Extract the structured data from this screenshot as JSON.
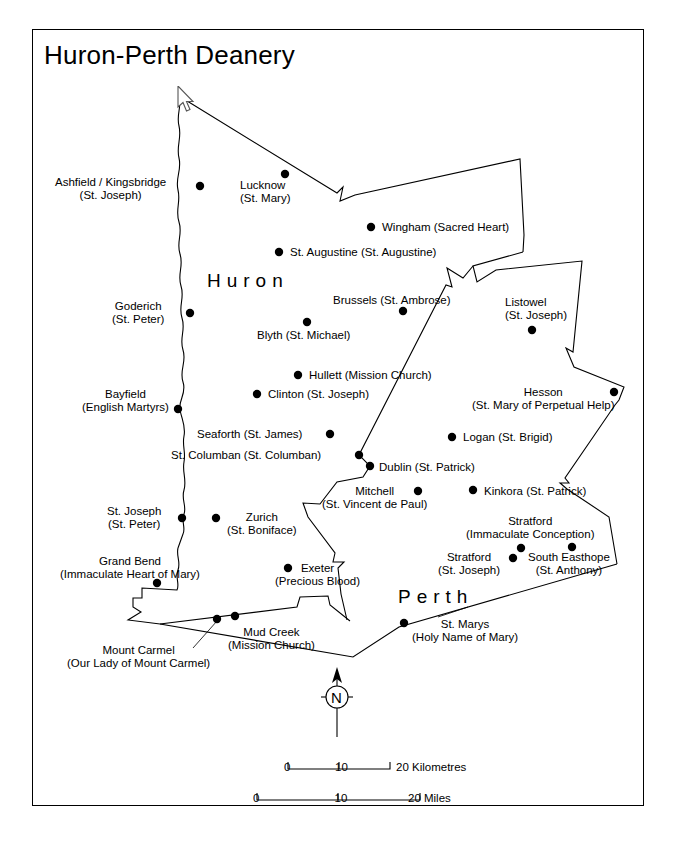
{
  "map": {
    "title": "Huron-Perth Deanery",
    "county_labels": [
      {
        "name": "Huron",
        "x": 207,
        "y": 270
      },
      {
        "name": "Perth",
        "x": 398,
        "y": 586
      }
    ],
    "places": [
      {
        "id": "ashfield-kingsbridge",
        "lines": [
          "Ashfield / Kingsbridge",
          "(St. Joseph)"
        ],
        "label_x": 55,
        "label_y": 176,
        "align": "center",
        "dot_x": 200,
        "dot_y": 186
      },
      {
        "id": "lucknow",
        "lines": [
          "Lucknow",
          "(St. Mary)"
        ],
        "label_x": 240,
        "label_y": 179,
        "align": "left",
        "dot_x": 285,
        "dot_y": 174
      },
      {
        "id": "wingham",
        "lines": [
          "Wingham (Sacred Heart)"
        ],
        "label_x": 382,
        "label_y": 221,
        "align": "left",
        "dot_x": 371,
        "dot_y": 227
      },
      {
        "id": "st-augustine",
        "lines": [
          "St. Augustine (St. Augustine)"
        ],
        "label_x": 290,
        "label_y": 246,
        "align": "left",
        "dot_x": 279,
        "dot_y": 252
      },
      {
        "id": "brussels",
        "lines": [
          "Brussels (St. Ambrose)"
        ],
        "label_x": 333,
        "label_y": 294,
        "align": "left",
        "dot_x": 403,
        "dot_y": 311
      },
      {
        "id": "listowel",
        "lines": [
          "Listowel",
          "(St. Joseph)"
        ],
        "label_x": 505,
        "label_y": 296,
        "align": "left",
        "dot_x": 532,
        "dot_y": 330
      },
      {
        "id": "goderich",
        "lines": [
          "Goderich",
          "(St. Peter)"
        ],
        "label_x": 112,
        "label_y": 300,
        "align": "center",
        "dot_x": 190,
        "dot_y": 313
      },
      {
        "id": "blyth",
        "lines": [
          "Blyth (St. Michael)"
        ],
        "label_x": 257,
        "label_y": 329,
        "align": "left",
        "dot_x": 307,
        "dot_y": 322
      },
      {
        "id": "hullett",
        "lines": [
          "Hullett (Mission Church)"
        ],
        "label_x": 309,
        "label_y": 369,
        "align": "left",
        "dot_x": 298,
        "dot_y": 375
      },
      {
        "id": "clinton",
        "lines": [
          "Clinton (St. Joseph)"
        ],
        "label_x": 268,
        "label_y": 388,
        "align": "left",
        "dot_x": 257,
        "dot_y": 394
      },
      {
        "id": "bayfield",
        "lines": [
          "Bayfield",
          "(English Martyrs)"
        ],
        "label_x": 82,
        "label_y": 388,
        "align": "center",
        "dot_x": 178,
        "dot_y": 409
      },
      {
        "id": "hesson",
        "lines": [
          "Hesson",
          "(St. Mary of Perpetual Help)"
        ],
        "label_x": 472,
        "label_y": 386,
        "align": "center",
        "dot_x": 614,
        "dot_y": 392
      },
      {
        "id": "seaforth",
        "lines": [
          "Seaforth (St. James)"
        ],
        "label_x": 197,
        "label_y": 428,
        "align": "left",
        "dot_x": 330,
        "dot_y": 434
      },
      {
        "id": "logan",
        "lines": [
          "Logan (St. Brigid)"
        ],
        "label_x": 463,
        "label_y": 431,
        "align": "left",
        "dot_x": 452,
        "dot_y": 437
      },
      {
        "id": "st-columban",
        "lines": [
          "St. Columban (St. Columban)"
        ],
        "label_x": 171,
        "label_y": 449,
        "align": "left",
        "dot_x": 359,
        "dot_y": 455
      },
      {
        "id": "dublin",
        "lines": [
          "Dublin (St. Patrick)"
        ],
        "label_x": 379,
        "label_y": 461,
        "align": "left",
        "dot_x": 370,
        "dot_y": 466
      },
      {
        "id": "mitchell",
        "lines": [
          "Mitchell",
          "(St. Vincent de Paul)"
        ],
        "label_x": 322,
        "label_y": 485,
        "align": "center",
        "dot_x": 418,
        "dot_y": 491
      },
      {
        "id": "kinkora",
        "lines": [
          "Kinkora (St. Patrick)"
        ],
        "label_x": 484,
        "label_y": 485,
        "align": "left",
        "dot_x": 473,
        "dot_y": 490
      },
      {
        "id": "st-joseph",
        "lines": [
          "St. Joseph",
          "(St. Peter)"
        ],
        "label_x": 107,
        "label_y": 505,
        "align": "center",
        "dot_x": 182,
        "dot_y": 518
      },
      {
        "id": "zurich",
        "lines": [
          "Zurich",
          "(St. Boniface)"
        ],
        "label_x": 227,
        "label_y": 511,
        "align": "center",
        "dot_x": 216,
        "dot_y": 518
      },
      {
        "id": "stratford-ic",
        "lines": [
          "Stratford",
          "(Immaculate Conception)"
        ],
        "label_x": 466,
        "label_y": 515,
        "align": "center",
        "dot_x": 521,
        "dot_y": 548
      },
      {
        "id": "stratford-sj",
        "lines": [
          "Stratford",
          "(St. Joseph)"
        ],
        "label_x": 438,
        "label_y": 551,
        "align": "center",
        "dot_x": 513,
        "dot_y": 558
      },
      {
        "id": "south-easthope",
        "lines": [
          "South Easthope",
          "(St. Anthony)"
        ],
        "label_x": 528,
        "label_y": 551,
        "align": "center",
        "dot_x": 572,
        "dot_y": 547
      },
      {
        "id": "grand-bend",
        "lines": [
          "Grand Bend",
          "(Immaculate Heart of Mary)"
        ],
        "label_x": 60,
        "label_y": 555,
        "align": "center",
        "dot_x": 157,
        "dot_y": 583
      },
      {
        "id": "exeter",
        "lines": [
          "Exeter",
          "(Precious Blood)"
        ],
        "label_x": 275,
        "label_y": 562,
        "align": "center",
        "dot_x": 288,
        "dot_y": 568
      },
      {
        "id": "st-marys",
        "lines": [
          "St. Marys",
          "(Holy Name of Mary)"
        ],
        "label_x": 412,
        "label_y": 618,
        "align": "center",
        "dot_x": 404,
        "dot_y": 623
      },
      {
        "id": "mud-creek",
        "lines": [
          "Mud Creek",
          "(Mission Church)"
        ],
        "label_x": 228,
        "label_y": 626,
        "align": "center",
        "dot_x": 235,
        "dot_y": 616
      },
      {
        "id": "mount-carmel",
        "lines": [
          "Mount Carmel",
          "(Our Lady of Mount Carmel)"
        ],
        "label_x": 67,
        "label_y": 644,
        "align": "center",
        "dot_x": 217,
        "dot_y": 619
      }
    ],
    "north_arrow": {
      "letter": "N",
      "x": 337,
      "y": 697
    },
    "scale_bars": [
      {
        "id": "kilometres",
        "unit_label": "20 Kilometres",
        "ticks": [
          "0",
          "10",
          "20"
        ],
        "x_start": 288,
        "x_end": 390,
        "y_line": 768,
        "y_text": 761,
        "unit_x": 396
      },
      {
        "id": "miles",
        "unit_label": "20 Miles",
        "ticks": [
          "0",
          "10",
          "20"
        ],
        "x_start": 257,
        "x_end": 420,
        "y_line": 799,
        "y_text": 792,
        "unit_x": 408
      }
    ],
    "colors": {
      "ink": "#000000",
      "background": "#ffffff",
      "frame": "#000000"
    }
  }
}
